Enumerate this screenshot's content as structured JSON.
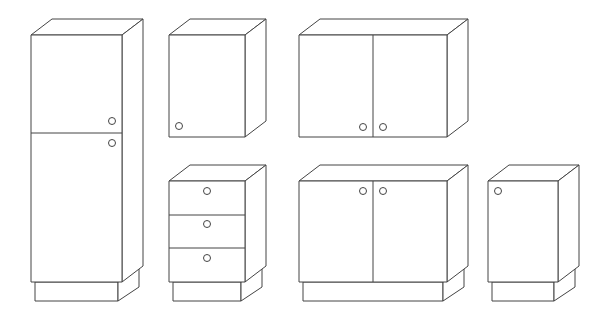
{
  "drawing": {
    "title": "Kitchen cabinet set (line drawing)",
    "stroke_color": "#444444",
    "background": "#ffffff",
    "depth": {
      "dx": 21,
      "dy": -16
    },
    "plinth_inset": 4,
    "knob_radius": 3.5
  },
  "cabinets": [
    {
      "id": "tall-cabinet",
      "type": "tall unit, two doors",
      "front": {
        "x": 31,
        "y": 35,
        "w": 91,
        "h": 247
      },
      "plinth": {
        "h": 19
      },
      "horizontal_dividers": [
        133
      ],
      "vertical_dividers": [],
      "knobs": [
        {
          "x": 112,
          "y": 121
        },
        {
          "x": 112,
          "y": 143
        }
      ]
    },
    {
      "id": "wall-cabinet-single",
      "type": "wall unit, single door",
      "front": {
        "x": 169,
        "y": 35,
        "w": 76,
        "h": 102
      },
      "plinth": null,
      "horizontal_dividers": [],
      "vertical_dividers": [],
      "knobs": [
        {
          "x": 179,
          "y": 126
        }
      ]
    },
    {
      "id": "wall-cabinet-double",
      "type": "wall unit, two doors",
      "front": {
        "x": 299,
        "y": 35,
        "w": 148,
        "h": 102
      },
      "plinth": null,
      "horizontal_dividers": [],
      "vertical_dividers": [
        373
      ],
      "knobs": [
        {
          "x": 363,
          "y": 127
        },
        {
          "x": 383,
          "y": 127
        }
      ]
    },
    {
      "id": "drawer-base",
      "type": "base unit, three drawers",
      "front": {
        "x": 169,
        "y": 181,
        "w": 76,
        "h": 101
      },
      "plinth": {
        "h": 19
      },
      "horizontal_dividers": [
        215,
        248
      ],
      "vertical_dividers": [],
      "knobs": [
        {
          "x": 207,
          "y": 191
        },
        {
          "x": 207,
          "y": 224
        },
        {
          "x": 207,
          "y": 258
        }
      ]
    },
    {
      "id": "base-cabinet-double",
      "type": "base unit, two doors",
      "front": {
        "x": 299,
        "y": 181,
        "w": 148,
        "h": 101
      },
      "plinth": {
        "h": 19
      },
      "horizontal_dividers": [],
      "vertical_dividers": [
        373
      ],
      "knobs": [
        {
          "x": 363,
          "y": 191
        },
        {
          "x": 383,
          "y": 191
        }
      ]
    },
    {
      "id": "base-cabinet-single",
      "type": "base unit, single door",
      "front": {
        "x": 488,
        "y": 181,
        "w": 70,
        "h": 101
      },
      "plinth": {
        "h": 19
      },
      "horizontal_dividers": [],
      "vertical_dividers": [],
      "knobs": [
        {
          "x": 498,
          "y": 191
        }
      ]
    }
  ]
}
